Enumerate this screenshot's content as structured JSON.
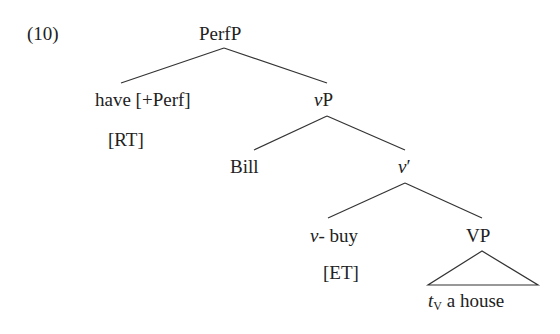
{
  "example_number": "(10)",
  "tree": {
    "root": "PerfP",
    "have": "have [+Perf]",
    "rt": "[RT]",
    "vP_italic": "v",
    "vP_rest": "P",
    "bill": "Bill",
    "vbar_italic": "v",
    "vbar_prime": "′",
    "vbuy_italic": "v",
    "vbuy_rest": "- buy",
    "et": "[ET]",
    "VP": "VP",
    "trace_t": "t",
    "trace_sub": "V",
    "trace_rest": " a house"
  }
}
